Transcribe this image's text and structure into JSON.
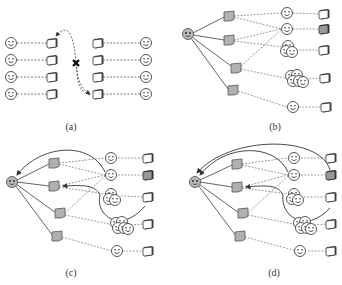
{
  "figure": {
    "panels": [
      {
        "id": "a",
        "caption": "(a)",
        "description": "Device pairing: users paired with devices, a cross-swap with blocked link"
      },
      {
        "id": "b",
        "caption": "(b)",
        "description": "Source user connects to four gray devices linked to users and groups with devices"
      },
      {
        "id": "c",
        "caption": "(c)",
        "description": "Feedback arrows from users/devices back to source"
      },
      {
        "id": "d",
        "caption": "(d)",
        "description": "Additional feedback arrows from end devices back to source"
      }
    ],
    "colors": {
      "stroke": "#333333",
      "gray_device": "#b0b0b0",
      "face_source": "#b8b8b8",
      "dashed": "#555555"
    },
    "icons": {
      "user": "smiley-face-icon",
      "device": "device-icon",
      "group": "user-group-icon",
      "blocked": "cross-icon"
    }
  }
}
